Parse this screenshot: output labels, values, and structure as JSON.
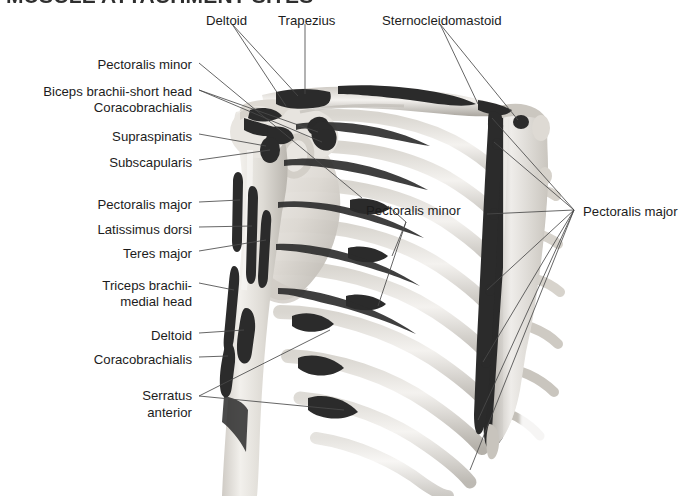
{
  "figure": {
    "title": "MUSCLE ATTACHMENT SITES",
    "type": "anatomical-illustration",
    "view": "anterior",
    "ink_color": "#262626",
    "bone_color": "#e8e6e2",
    "attachment_color": "#2b2b2b",
    "leader_color": "#4a4a4a",
    "background_color": "#ffffff"
  },
  "labels": {
    "top": [
      {
        "id": "deltoid-top",
        "text": "Deltoid",
        "x": 206,
        "y": 13,
        "align": "left"
      },
      {
        "id": "trapezius-top",
        "text": "Trapezius",
        "x": 278,
        "y": 13,
        "align": "left"
      },
      {
        "id": "sternocleidomastoid",
        "text": "Sternocleidomastoid",
        "x": 382,
        "y": 13,
        "align": "left"
      }
    ],
    "left": [
      {
        "id": "pectoralis-minor-left",
        "text": "Pectoralis minor",
        "x": 192,
        "y": 57,
        "align": "right"
      },
      {
        "id": "biceps-brachii-short-head",
        "text": "Biceps brachii-short head",
        "x": 192,
        "y": 84,
        "align": "right"
      },
      {
        "id": "coracobrachialis-upper",
        "text": "Coracobrachialis",
        "x": 192,
        "y": 100,
        "align": "right"
      },
      {
        "id": "supraspinatus",
        "text": "Supraspinatis",
        "x": 192,
        "y": 129,
        "align": "right"
      },
      {
        "id": "subscapularis",
        "text": "Subscapularis",
        "x": 192,
        "y": 155,
        "align": "right"
      },
      {
        "id": "pectoralis-major-left",
        "text": "Pectoralis major",
        "x": 192,
        "y": 197,
        "align": "right"
      },
      {
        "id": "latissimus-dorsi",
        "text": "Latissimus dorsi",
        "x": 192,
        "y": 222,
        "align": "right"
      },
      {
        "id": "teres-major",
        "text": "Teres major",
        "x": 192,
        "y": 246,
        "align": "right"
      },
      {
        "id": "triceps-brachii-line1",
        "text": "Triceps brachii-",
        "x": 192,
        "y": 278,
        "align": "right"
      },
      {
        "id": "triceps-brachii-line2",
        "text": "medial head",
        "x": 192,
        "y": 294,
        "align": "right"
      },
      {
        "id": "deltoid-lower",
        "text": "Deltoid",
        "x": 192,
        "y": 328,
        "align": "right"
      },
      {
        "id": "coracobrachialis-lower",
        "text": "Coracobrachialis",
        "x": 192,
        "y": 352,
        "align": "right"
      },
      {
        "id": "serratus-anterior-line1",
        "text": "Serratus",
        "x": 192,
        "y": 388,
        "align": "right"
      },
      {
        "id": "serratus-anterior-line2",
        "text": "anterior",
        "x": 192,
        "y": 405,
        "align": "right"
      }
    ],
    "right": [
      {
        "id": "pectoralis-major-right",
        "text": "Pectoralis major",
        "x": 583,
        "y": 204,
        "align": "left"
      }
    ],
    "inset": [
      {
        "id": "pectoralis-minor-center",
        "text": "Pectoralis minor",
        "x": 366,
        "y": 203,
        "align": "left"
      }
    ]
  },
  "muscles_shown": [
    "Deltoid",
    "Trapezius",
    "Sternocleidomastoid",
    "Pectoralis minor",
    "Pectoralis major",
    "Biceps brachii-short head",
    "Coracobrachialis",
    "Supraspinatis",
    "Subscapularis",
    "Latissimus dorsi",
    "Teres major",
    "Triceps brachii-medial head",
    "Serratus anterior"
  ]
}
